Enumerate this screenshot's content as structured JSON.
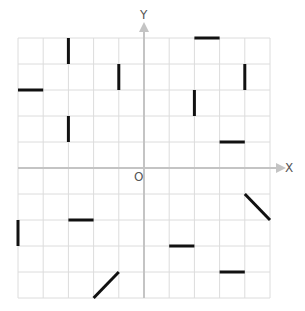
{
  "diagram": {
    "type": "coordinate-grid",
    "axes": {
      "x_label": "X",
      "y_label": "Y",
      "origin_label": "O"
    },
    "grid": {
      "x_min": -5,
      "x_max": 5,
      "y_min": -5,
      "y_max": 5,
      "step": 1
    },
    "colors": {
      "grid_line": "#dcdcdc",
      "axis_line": "#c4c4c4",
      "segment": "#111111",
      "label": "#555555"
    },
    "segments": [
      {
        "x1": -3,
        "y1": 5,
        "x2": -3,
        "y2": 4
      },
      {
        "x1": 2,
        "y1": 5,
        "x2": 3,
        "y2": 5
      },
      {
        "x1": -1,
        "y1": 4,
        "x2": -1,
        "y2": 3
      },
      {
        "x1": 4,
        "y1": 4,
        "x2": 4,
        "y2": 3
      },
      {
        "x1": -5,
        "y1": 3,
        "x2": -4,
        "y2": 3
      },
      {
        "x1": 2,
        "y1": 3,
        "x2": 2,
        "y2": 2
      },
      {
        "x1": -3,
        "y1": 2,
        "x2": -3,
        "y2": 1
      },
      {
        "x1": 3,
        "y1": 1,
        "x2": 4,
        "y2": 1
      },
      {
        "x1": 4,
        "y1": -1,
        "x2": 5,
        "y2": -2
      },
      {
        "x1": -3,
        "y1": -2,
        "x2": -2,
        "y2": -2
      },
      {
        "x1": -5,
        "y1": -2,
        "x2": -5,
        "y2": -3
      },
      {
        "x1": 1,
        "y1": -3,
        "x2": 2,
        "y2": -3
      },
      {
        "x1": 3,
        "y1": -4,
        "x2": 4,
        "y2": -4
      },
      {
        "x1": -2,
        "y1": -5,
        "x2": -1,
        "y2": -4
      }
    ]
  }
}
